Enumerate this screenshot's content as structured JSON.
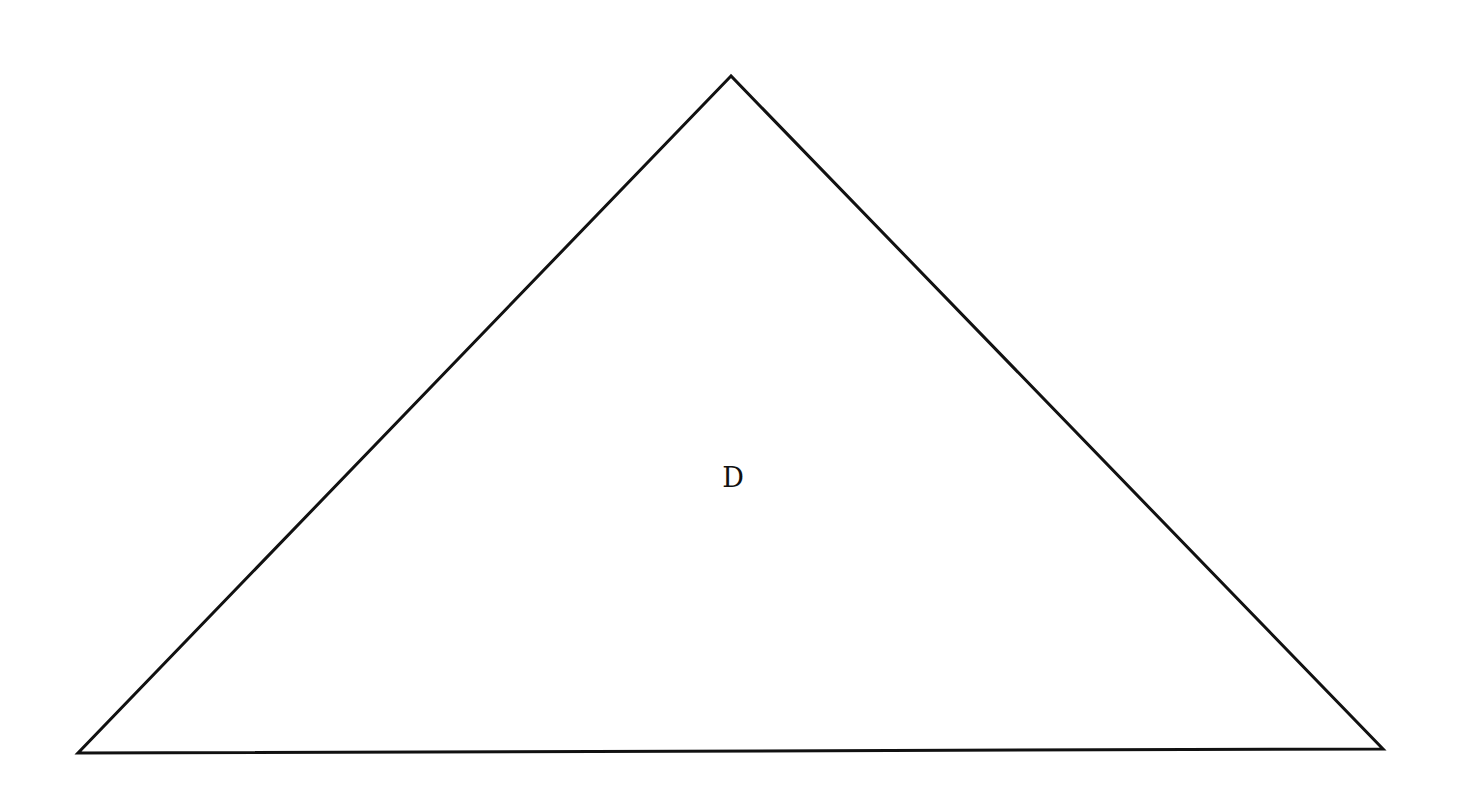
{
  "diagram": {
    "type": "triangle",
    "stroke_color": "#111111",
    "fill_color": "#ffffff",
    "stroke_width": 3,
    "vertices": {
      "apex": [
        731,
        76
      ],
      "bottom_left": [
        78,
        753
      ],
      "bottom_right": [
        1383,
        749
      ]
    },
    "label": {
      "text": "D",
      "position": [
        733,
        477
      ]
    }
  }
}
